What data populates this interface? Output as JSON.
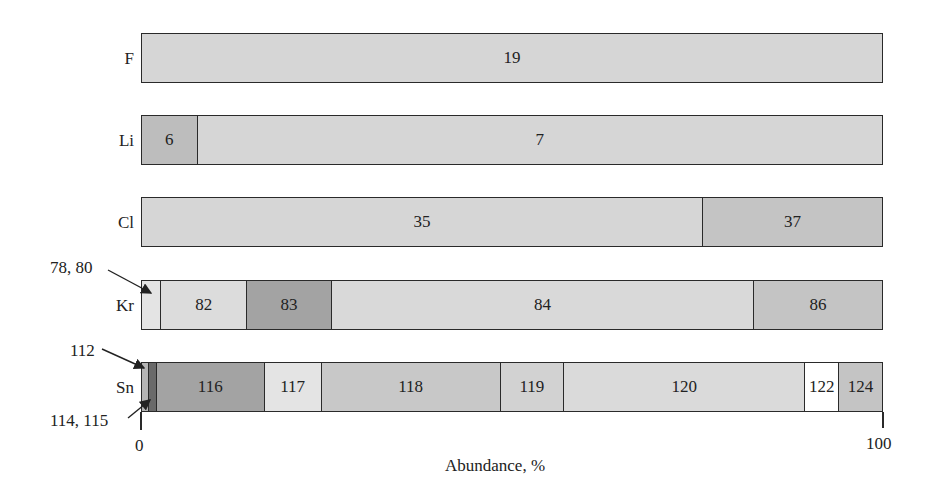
{
  "chart_data": {
    "type": "bar",
    "orientation": "horizontal-stacked",
    "title": "",
    "xlabel": "Abundance, %",
    "ylabel": "",
    "xlim": [
      0,
      100
    ],
    "x_ticks": [
      "0",
      "100"
    ],
    "grid": false,
    "legend": null,
    "categories": [
      "F",
      "Li",
      "Cl",
      "Kr",
      "Sn"
    ],
    "rows": [
      {
        "element": "F",
        "segments": [
          {
            "label": "19",
            "value": 100.0,
            "color": "#d6d6d6"
          }
        ]
      },
      {
        "element": "Li",
        "segments": [
          {
            "label": "6",
            "value": 7.5,
            "color": "#bdbdbd"
          },
          {
            "label": "7",
            "value": 92.5,
            "color": "#d6d6d6"
          }
        ]
      },
      {
        "element": "Cl",
        "segments": [
          {
            "label": "35",
            "value": 75.8,
            "color": "#d6d6d6"
          },
          {
            "label": "37",
            "value": 24.2,
            "color": "#c4c4c4"
          }
        ]
      },
      {
        "element": "Kr",
        "segments": [
          {
            "label": "",
            "value": 2.6,
            "color": "#e4e4e4",
            "callout": "78, 80"
          },
          {
            "label": "82",
            "value": 11.6,
            "color": "#dcdcdc"
          },
          {
            "label": "83",
            "value": 11.5,
            "color": "#a3a3a3"
          },
          {
            "label": "84",
            "value": 57.0,
            "color": "#d9d9d9"
          },
          {
            "label": "86",
            "value": 17.3,
            "color": "#c4c4c4"
          }
        ]
      },
      {
        "element": "Sn",
        "segments": [
          {
            "label": "",
            "value": 1.0,
            "color": "#b5b5b5",
            "callout": "112"
          },
          {
            "label": "",
            "value": 1.0,
            "color": "#6a6a6a",
            "callout": "114, 115"
          },
          {
            "label": "116",
            "value": 14.6,
            "color": "#a3a3a3"
          },
          {
            "label": "117",
            "value": 7.7,
            "color": "#e4e4e4"
          },
          {
            "label": "118",
            "value": 24.2,
            "color": "#c8c8c8"
          },
          {
            "label": "119",
            "value": 8.6,
            "color": "#d2d2d2"
          },
          {
            "label": "120",
            "value": 32.6,
            "color": "#dadada"
          },
          {
            "label": "122",
            "value": 4.6,
            "color": "#ffffff"
          },
          {
            "label": "124",
            "value": 5.8,
            "color": "#c4c4c4"
          }
        ]
      }
    ]
  },
  "labels": {
    "rows": [
      "F",
      "Li",
      "Cl",
      "Kr",
      "Sn"
    ],
    "callouts": {
      "kr": "78, 80",
      "sn_top": "112",
      "sn_bottom": "114, 115"
    },
    "ticks": {
      "min": "0",
      "max": "100"
    },
    "xlabel": "Abundance, %"
  }
}
